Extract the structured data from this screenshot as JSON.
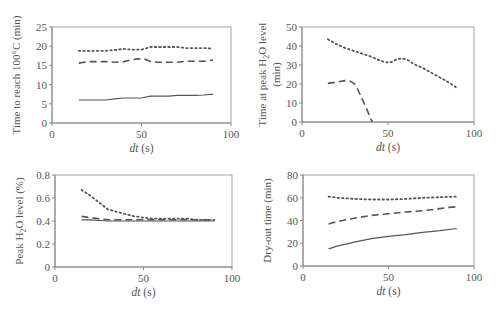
{
  "figure": {
    "panels_count": 4,
    "line_color": "#555555",
    "axis_color": "#888888",
    "frame_color": "#999999",
    "text_color": "#555555"
  },
  "chart_data": [
    {
      "type": "line",
      "id": "time-to-100c",
      "title": "",
      "xlabel": "dt (s)",
      "ylabel": "Time to reach 100°C (min)",
      "xlim": [
        0,
        100
      ],
      "ylim": [
        0,
        25
      ],
      "xticks": [
        0,
        50,
        100
      ],
      "yticks": [
        0,
        5,
        10,
        15,
        20,
        25
      ],
      "grid": false,
      "legend": null,
      "box": {
        "left": 52,
        "right": 231,
        "top": 27,
        "bottom": 123
      },
      "series": [
        {
          "name": "dotted",
          "style": "dotted",
          "x": [
            15,
            20,
            30,
            35,
            40,
            45,
            50,
            55,
            60,
            65,
            70,
            75,
            80,
            85,
            90
          ],
          "y": [
            18.8,
            18.8,
            18.8,
            19.0,
            19.3,
            19.1,
            19.1,
            19.8,
            19.8,
            19.8,
            19.8,
            19.5,
            19.5,
            19.5,
            19.4
          ]
        },
        {
          "name": "dashed",
          "style": "dashed",
          "x": [
            15,
            20,
            30,
            35,
            40,
            45,
            48,
            52,
            55,
            60,
            65,
            70,
            75,
            80,
            85,
            90
          ],
          "y": [
            15.6,
            16.0,
            16.0,
            15.8,
            16.0,
            16.5,
            16.7,
            16.6,
            16.0,
            15.8,
            15.8,
            15.8,
            16.1,
            16.1,
            16.1,
            16.4
          ]
        },
        {
          "name": "solid",
          "style": "solid",
          "x": [
            15,
            20,
            25,
            30,
            35,
            40,
            45,
            50,
            55,
            60,
            65,
            70,
            75,
            80,
            85,
            90
          ],
          "y": [
            6.0,
            6.0,
            6.0,
            6.0,
            6.3,
            6.5,
            6.5,
            6.5,
            7.0,
            7.0,
            7.0,
            7.2,
            7.2,
            7.2,
            7.3,
            7.5
          ]
        }
      ]
    },
    {
      "type": "line",
      "id": "time-at-peak-h2o",
      "title": "",
      "xlabel": "dt (s)",
      "ylabel": "Time at peak H2O level (min)",
      "ylabel_line1": "Time at peak H",
      "ylabel_sub": "2",
      "ylabel_line1_end": "O level",
      "ylabel_line2": "(min)",
      "xlim": [
        0,
        100
      ],
      "ylim": [
        0,
        50
      ],
      "xticks": [
        0,
        50,
        100
      ],
      "yticks": [
        0,
        10,
        20,
        30,
        40,
        50
      ],
      "grid": false,
      "legend": null,
      "box": {
        "left": 302,
        "right": 474,
        "top": 27,
        "bottom": 122
      },
      "series": [
        {
          "name": "dotted",
          "style": "dotted",
          "x": [
            15,
            20,
            25,
            30,
            35,
            40,
            45,
            48,
            50,
            52,
            55,
            58,
            62,
            65,
            70,
            75,
            80,
            85,
            90
          ],
          "y": [
            43.5,
            41.0,
            39.0,
            37.5,
            36.0,
            34.5,
            32.5,
            31.5,
            31.3,
            31.5,
            33.0,
            33.5,
            32.5,
            30.5,
            28.5,
            26.0,
            23.5,
            21.0,
            18.0
          ]
        },
        {
          "name": "dashed",
          "style": "dashed",
          "x": [
            15,
            20,
            25,
            28,
            30,
            32,
            35,
            38,
            40,
            41
          ],
          "y": [
            20.3,
            21.0,
            21.8,
            21.5,
            20.5,
            18.0,
            12.0,
            6.0,
            1.5,
            0
          ]
        },
        {
          "name": "solid",
          "style": "solid",
          "x": [],
          "y": []
        }
      ]
    },
    {
      "type": "line",
      "id": "peak-h2o-level",
      "title": "",
      "xlabel": "dt (s)",
      "ylabel": "Peak H2O level (%)",
      "ylabel_line1": "Peak H",
      "ylabel_sub": "2",
      "ylabel_line1_end": "O level (%)",
      "xlim": [
        0,
        100
      ],
      "ylim": [
        0,
        0.8
      ],
      "xticks": [
        0,
        50,
        100
      ],
      "yticks": [
        0,
        0.2,
        0.4,
        0.6,
        0.8
      ],
      "ytick_labels": [
        "0",
        "0.2",
        "0.4",
        "0.6",
        "0.8"
      ],
      "grid": false,
      "legend": null,
      "box": {
        "left": 55,
        "right": 232,
        "top": 175,
        "bottom": 267
      },
      "series": [
        {
          "name": "dotted",
          "style": "dotted",
          "x": [
            15,
            20,
            25,
            30,
            35,
            40,
            45,
            50,
            55,
            60,
            65,
            70,
            75,
            80,
            85,
            90
          ],
          "y": [
            0.67,
            0.62,
            0.56,
            0.5,
            0.48,
            0.46,
            0.44,
            0.43,
            0.42,
            0.42,
            0.42,
            0.42,
            0.42,
            0.41,
            0.41,
            0.41
          ]
        },
        {
          "name": "dashed",
          "style": "dashed",
          "x": [
            15,
            20,
            25,
            30,
            40,
            50,
            60,
            70,
            80,
            90
          ],
          "y": [
            0.44,
            0.43,
            0.42,
            0.41,
            0.41,
            0.41,
            0.41,
            0.41,
            0.41,
            0.41
          ]
        },
        {
          "name": "solid",
          "style": "solid",
          "x": [
            15,
            20,
            30,
            40,
            50,
            60,
            70,
            80,
            90
          ],
          "y": [
            0.41,
            0.41,
            0.4,
            0.4,
            0.4,
            0.4,
            0.4,
            0.4,
            0.4
          ]
        }
      ]
    },
    {
      "type": "line",
      "id": "dry-out-time",
      "title": "",
      "xlabel": "dt (s)",
      "ylabel": "Dry-out time (min)",
      "xlim": [
        0,
        100
      ],
      "ylim": [
        0,
        80
      ],
      "xticks": [
        0,
        50,
        100
      ],
      "yticks": [
        0,
        20,
        40,
        60,
        80
      ],
      "grid": false,
      "legend": null,
      "box": {
        "left": 303,
        "right": 474,
        "top": 175,
        "bottom": 266
      },
      "series": [
        {
          "name": "dotted",
          "style": "dotted",
          "x": [
            15,
            20,
            25,
            30,
            40,
            50,
            60,
            70,
            80,
            90
          ],
          "y": [
            61,
            60,
            59.5,
            59,
            58.5,
            58.5,
            59,
            60,
            60.5,
            61
          ]
        },
        {
          "name": "dashed",
          "style": "dashed",
          "x": [
            15,
            20,
            30,
            40,
            50,
            60,
            70,
            80,
            85,
            90
          ],
          "y": [
            37,
            39,
            42,
            44.5,
            46,
            47.5,
            48.5,
            50.5,
            51.5,
            52
          ]
        },
        {
          "name": "solid",
          "style": "solid",
          "x": [
            15,
            20,
            30,
            40,
            50,
            60,
            70,
            80,
            90
          ],
          "y": [
            15,
            17.5,
            21,
            24,
            26,
            27.5,
            29.5,
            31,
            33
          ]
        }
      ]
    }
  ]
}
